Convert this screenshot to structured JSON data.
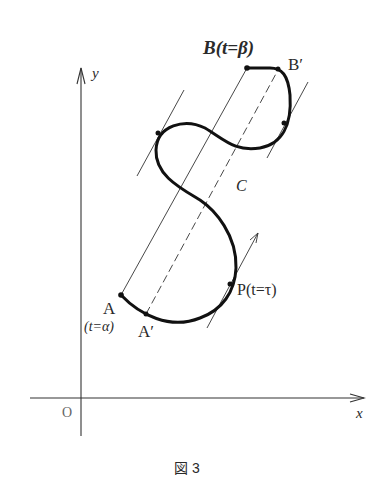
{
  "figure": {
    "caption": "図 3",
    "axes": {
      "x_label": "x",
      "y_label": "y",
      "origin_label": "O"
    },
    "points": {
      "B": "B(t=β)",
      "B_prime": "B′",
      "A": "A",
      "A_param": "(t=α)",
      "A_prime": "A′",
      "P": "P(t=τ)",
      "C": "C"
    },
    "colors": {
      "curve": "#111111",
      "lines": "#333333",
      "text": "#2a2a2a",
      "background": "#ffffff"
    }
  }
}
